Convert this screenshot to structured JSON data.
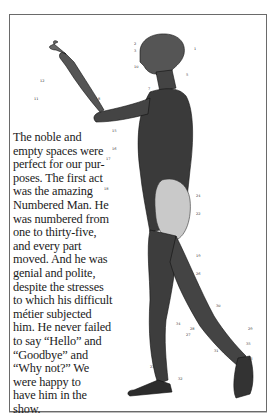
{
  "illustration": {
    "subject": "anatomical-figure-numbered-man",
    "label_numbers": [
      "2",
      "1",
      "3",
      "4",
      "5",
      "6",
      "7",
      "8",
      "9",
      "10",
      "11",
      "12",
      "13",
      "14",
      "15",
      "16",
      "17",
      "18",
      "19",
      "20",
      "21",
      "22",
      "23",
      "24",
      "25",
      "26",
      "27",
      "28",
      "29",
      "30",
      "31",
      "32",
      "33",
      "34",
      "35"
    ]
  },
  "passage": {
    "lines": [
      "The noble and",
      "empty spaces were",
      "perfect for our pur-",
      "poses. The first act",
      "was the amazing",
      "Numbered Man. He",
      "was numbered from",
      "one to thirty-five,",
      "and every part",
      "moved. And he was",
      "genial and polite,",
      "despite the stresses",
      "to which his difficult",
      "métier subjected",
      "him. He never failed",
      "to say “Hello” and",
      "“Goodbye” and",
      "“Why not?” We",
      "were happy to",
      "have him in the",
      "show."
    ]
  },
  "colors": {
    "ink": "#1b1b1b",
    "frame": "#6a6a6a"
  }
}
